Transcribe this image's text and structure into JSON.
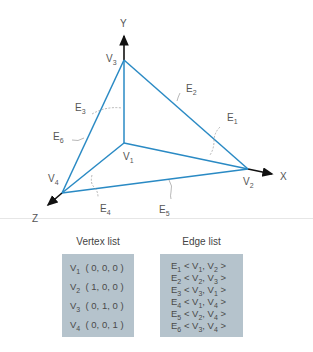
{
  "figure": {
    "axes": {
      "x_label": "X",
      "y_label": "Y",
      "z_label": "Z"
    },
    "vertices": [
      {
        "name": "V",
        "sub": "1",
        "coords": "( 0, 0, 0 )"
      },
      {
        "name": "V",
        "sub": "2",
        "coords": "( 1, 0, 0 )"
      },
      {
        "name": "V",
        "sub": "3",
        "coords": "( 0, 1, 0 )"
      },
      {
        "name": "V",
        "sub": "4",
        "coords": "( 0, 0, 1 )"
      }
    ],
    "edges": [
      {
        "name": "E",
        "sub": "1",
        "a": "1",
        "b": "2"
      },
      {
        "name": "E",
        "sub": "2",
        "a": "2",
        "b": "3"
      },
      {
        "name": "E",
        "sub": "3",
        "a": "3",
        "b": "1"
      },
      {
        "name": "E",
        "sub": "4",
        "a": "1",
        "b": "4"
      },
      {
        "name": "E",
        "sub": "5",
        "a": "2",
        "b": "4"
      },
      {
        "name": "E",
        "sub": "6",
        "a": "3",
        "b": "4"
      }
    ],
    "edge_color": "#2a8ac4",
    "box_color": "#b5c3cc"
  },
  "vertex_list": {
    "title": "Vertex list"
  },
  "edge_list": {
    "title": "Edge list"
  }
}
